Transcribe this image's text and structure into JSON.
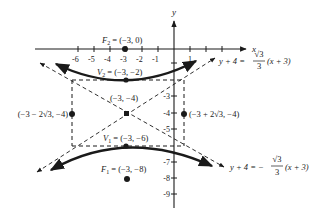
{
  "diagram": {
    "type": "hyperbola",
    "axes": {
      "x_label": "x",
      "y_label": "y",
      "x_ticks": [
        "-6",
        "-5",
        "-4",
        "-3",
        "-2",
        "-1",
        "1"
      ],
      "y_ticks": [
        "-3",
        "-4",
        "-5",
        "-7",
        "-8",
        "-9"
      ]
    },
    "points": {
      "f2": {
        "name": "F",
        "sub": "2",
        "coords": " = (−3, 0)"
      },
      "v2": {
        "name": "V",
        "sub": "2",
        "coords": " = (−3, −2)"
      },
      "center": {
        "label": "(−3, −4)"
      },
      "v1": {
        "name": "V",
        "sub": "1",
        "coords": " = (−3, −6)"
      },
      "f1": {
        "name": "F",
        "sub": "1",
        "coords": " = (−3, −8)"
      },
      "left": {
        "label": "(−3 − 2√3, −4)"
      },
      "right": {
        "label": "(−3 + 2√3, −4)"
      }
    },
    "asymptotes": {
      "upper": {
        "lhs": "y + 4 = ",
        "num": "√3",
        "den": "3",
        "rhs": "(x + 3)"
      },
      "lower": {
        "lhs": "y + 4 = −",
        "num": "√3",
        "den": "3",
        "rhs": "(x + 3)"
      }
    },
    "colors": {
      "ink": "#1a1a1a",
      "background": "#ffffff"
    }
  }
}
